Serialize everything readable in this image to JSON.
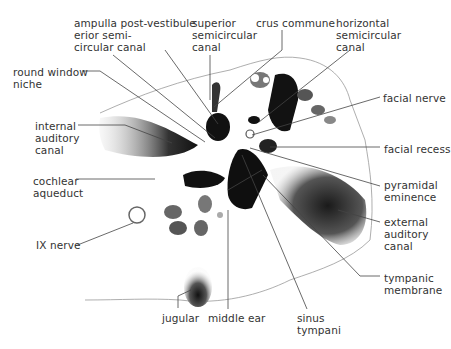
{
  "diagram": {
    "labels": [
      {
        "id": "ampulla",
        "text": "ampulla post-\nerior semi-\ncircular canal",
        "x": 74,
        "y": 17
      },
      {
        "id": "vestibule",
        "text": "vestibule",
        "x": 147,
        "y": 17
      },
      {
        "id": "superior-canal",
        "text": "superior\nsemicircular\ncanal",
        "x": 192,
        "y": 17
      },
      {
        "id": "crus-commune",
        "text": "crus commune",
        "x": 256,
        "y": 17
      },
      {
        "id": "horizontal-canal",
        "text": "horizontal\nsemicircular\ncanal",
        "x": 336,
        "y": 17
      },
      {
        "id": "round-window",
        "text": "round window\nniche",
        "x": 13,
        "y": 66
      },
      {
        "id": "facial-nerve",
        "text": "facial nerve",
        "x": 383,
        "y": 92
      },
      {
        "id": "internal-auditory",
        "text": "internal\nauditory\ncanal",
        "x": 35,
        "y": 120
      },
      {
        "id": "facial-recess",
        "text": "facial recess",
        "x": 384,
        "y": 143
      },
      {
        "id": "cochlear-aqueduct",
        "text": "cochlear\naqueduct",
        "x": 33,
        "y": 175
      },
      {
        "id": "pyramidal",
        "text": "pyramidal\neminence",
        "x": 384,
        "y": 179
      },
      {
        "id": "external-auditory",
        "text": "external\nauditory\ncanal",
        "x": 384,
        "y": 216
      },
      {
        "id": "ix-nerve",
        "text": "IX nerve",
        "x": 36,
        "y": 239
      },
      {
        "id": "tympanic-membrane",
        "text": "tympanic\nmembrane",
        "x": 384,
        "y": 272
      },
      {
        "id": "jugular",
        "text": "jugular",
        "x": 162,
        "y": 312
      },
      {
        "id": "middle-ear",
        "text": "middle ear",
        "x": 208,
        "y": 312
      },
      {
        "id": "sinus-tympani",
        "text": "sinus\ntympani",
        "x": 297,
        "y": 312
      }
    ],
    "colors": {
      "label": "#333333",
      "leader": "#444444",
      "dark": "#141414",
      "mid": "#6a6a6a",
      "outline": "#8a8a8a"
    }
  }
}
